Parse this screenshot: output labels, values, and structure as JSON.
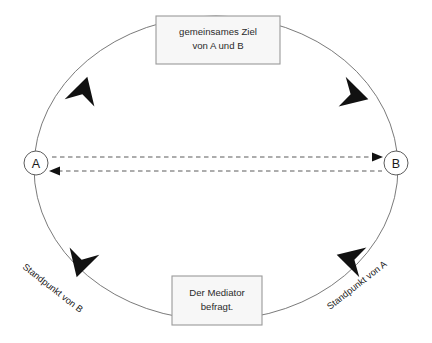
{
  "diagram": {
    "background_color": "#ffffff",
    "line_color": "#6b6b6b",
    "arrow_color": "#111111",
    "box_fill": "#f7f7f7",
    "box_border": "#9a9a9a",
    "nodes": [
      {
        "id": "a",
        "label": "A",
        "cx": 36,
        "cy": 163,
        "r": 12
      },
      {
        "id": "b",
        "label": "B",
        "cx": 396,
        "cy": 163,
        "r": 12
      }
    ],
    "boxes": [
      {
        "id": "goal-box",
        "name": "gemeinsames-ziel-box",
        "line1": "gemeinsames Ziel",
        "line2": "von A und B",
        "x": 156,
        "y": 16,
        "width": 124,
        "height": 48
      },
      {
        "id": "mediator-box",
        "name": "mediator-box",
        "line1": "Der Mediator",
        "line2": "befragt.",
        "x": 172,
        "y": 276,
        "width": 90,
        "height": 49
      }
    ],
    "side_labels": [
      {
        "id": "standpunkt-b",
        "text": "Standpunkt von B",
        "x": 22,
        "y": 268,
        "rotation": 38
      },
      {
        "id": "standpunkt-a",
        "text": "Standpunkt von A",
        "x": 330,
        "y": 310,
        "rotation": -38
      }
    ],
    "center_arrows": [
      {
        "id": "a-to-b",
        "direction": "right",
        "label": ""
      },
      {
        "id": "b-to-a",
        "direction": "left",
        "label": ""
      }
    ],
    "cycle_arrow_count": 4
  }
}
